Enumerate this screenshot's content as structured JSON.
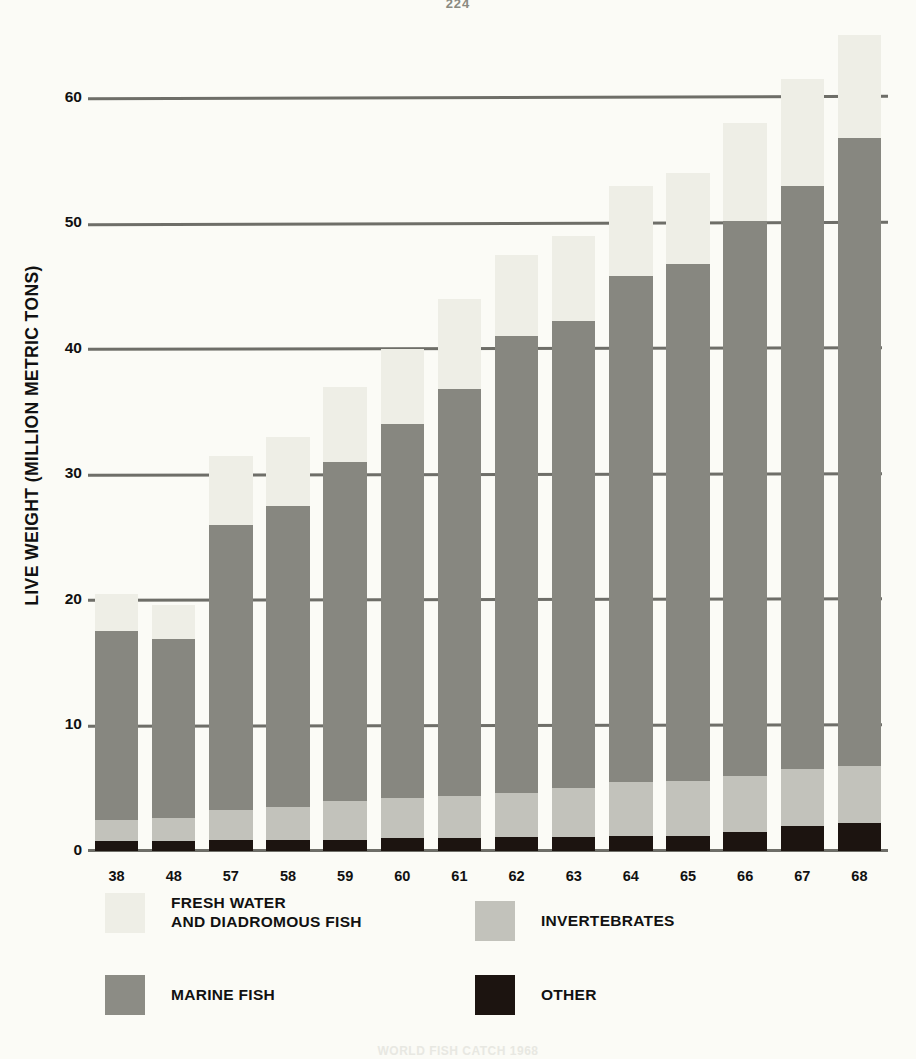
{
  "page": {
    "number": "224",
    "caption": "WORLD FISH CATCH 1968"
  },
  "chart_data": {
    "type": "bar",
    "subtype": "stacked-bar",
    "title": "",
    "xlabel": "",
    "ylabel": "LIVE WEIGHT (MILLION METRIC TONS)",
    "ylim": [
      0,
      67
    ],
    "yticks": [
      0,
      10,
      20,
      30,
      40,
      50,
      60
    ],
    "ytick_labels": [
      "0",
      "10",
      "20",
      "30",
      "40",
      "50",
      "60"
    ],
    "grid": "horizontal",
    "legend_position": "below",
    "categories": [
      "38",
      "48",
      "57",
      "58",
      "59",
      "60",
      "61",
      "62",
      "63",
      "64",
      "65",
      "66",
      "67",
      "68"
    ],
    "stack_order_bottom_to_top": [
      "OTHER",
      "INVERTEBRATES",
      "MARINE FISH",
      "FRESH WATER AND DIADROMOUS FISH"
    ],
    "series": [
      {
        "name": "OTHER",
        "color": "#1c1410",
        "values": [
          0.8,
          0.8,
          0.9,
          0.9,
          0.9,
          1.0,
          1.0,
          1.1,
          1.1,
          1.2,
          1.2,
          1.5,
          2.0,
          2.2
        ]
      },
      {
        "name": "INVERTEBRATES",
        "color": "#c2c2bb",
        "values": [
          1.7,
          1.8,
          2.4,
          2.6,
          3.1,
          3.2,
          3.4,
          3.5,
          3.9,
          4.3,
          4.4,
          4.5,
          4.5,
          4.6
        ]
      },
      {
        "name": "MARINE FISH",
        "color": "#878780",
        "values": [
          15.0,
          14.3,
          22.7,
          24.0,
          27.0,
          29.8,
          32.4,
          36.4,
          37.2,
          40.3,
          41.2,
          44.2,
          46.5,
          50.0
        ]
      },
      {
        "name": "FRESH WATER AND DIADROMOUS FISH",
        "color": "#eeeee6",
        "values": [
          3.0,
          2.7,
          5.5,
          5.5,
          6.0,
          6.0,
          7.2,
          6.5,
          6.8,
          7.2,
          7.2,
          7.8,
          8.5,
          8.2
        ]
      }
    ],
    "totals": [
      20.5,
      19.6,
      31.5,
      33.0,
      37.0,
      40.0,
      44.0,
      47.5,
      49.0,
      53.0,
      54.0,
      58.0,
      61.5,
      65.0
    ]
  },
  "legend": {
    "items": [
      {
        "label": "FRESH WATER\nAND DIADROMOUS FISH",
        "swatch": "fresh"
      },
      {
        "label": "INVERTEBRATES",
        "swatch": "invert"
      },
      {
        "label": "MARINE FISH",
        "swatch": "marine"
      },
      {
        "label": "OTHER",
        "swatch": "other"
      }
    ]
  }
}
